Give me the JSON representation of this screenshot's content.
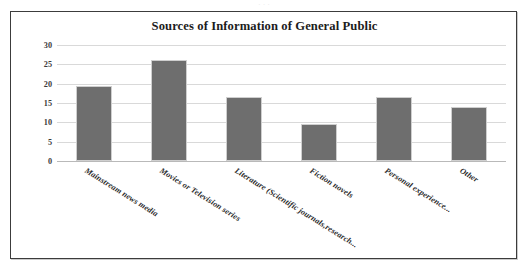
{
  "page": {
    "top_bleed_text": "· · ·"
  },
  "figure": {
    "title": "Sources of Information of General Public"
  },
  "chart_data": {
    "type": "bar",
    "title": "Sources of Information of General Public",
    "xlabel": "",
    "ylabel": "",
    "ylim": [
      0,
      30
    ],
    "yticks": [
      0,
      5,
      10,
      15,
      20,
      25,
      30
    ],
    "ytick_labels": [
      "0",
      "5",
      "10",
      "15",
      "20",
      "25",
      "30"
    ],
    "grid": true,
    "legend": false,
    "bar_color": "#6e6e6e",
    "categories": [
      "Mainstream news media",
      "Movies or Television series",
      "Literature (Scientific journals,research...",
      "Fiction novels",
      "Personal experience...",
      "Other"
    ],
    "values": [
      19.5,
      26,
      16.5,
      9.5,
      16.5,
      14
    ]
  }
}
